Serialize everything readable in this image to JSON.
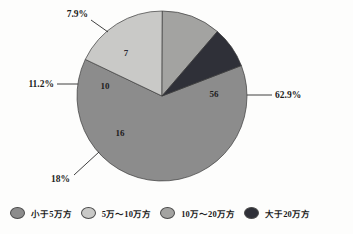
{
  "chart_data": {
    "type": "pie",
    "title": "",
    "categories": [
      "小于5万方",
      "5万～10万方",
      "10万～20万方",
      "大于20万方"
    ],
    "values": [
      56,
      16,
      10,
      7
    ],
    "value_labels": [
      "56",
      "16",
      "10",
      "7"
    ],
    "percent_labels": [
      "62.9%",
      "18%",
      "11.2%",
      "7.9%"
    ],
    "percents": [
      62.9,
      18.0,
      11.2,
      7.9
    ],
    "colors": [
      "#8c8c8c",
      "#c9c9c7",
      "#a3a3a1",
      "#2f3038"
    ],
    "legend_position": "bottom",
    "grid": false,
    "start_angle_deg": -21,
    "direction": "clockwise"
  },
  "legend": {
    "items": [
      {
        "label": "小于5万方",
        "color": "#8c8c8c"
      },
      {
        "label": "5万～10万方",
        "color": "#c9c9c7"
      },
      {
        "label": "10万～20万方",
        "color": "#a3a3a1"
      },
      {
        "label": "大于20万方",
        "color": "#2f3038"
      }
    ]
  },
  "callouts": {
    "right": "62.9%",
    "bottom_left": "18%",
    "left": "11.2%",
    "top_left": "7.9%"
  }
}
